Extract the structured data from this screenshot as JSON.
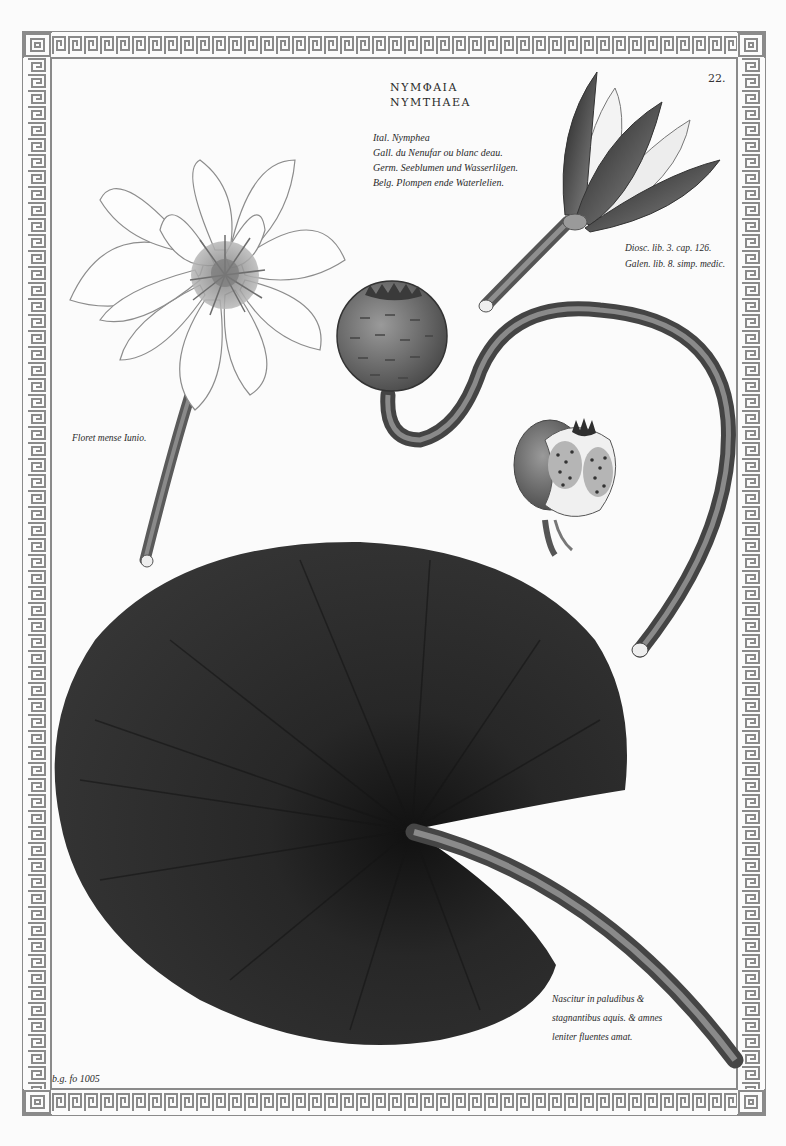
{
  "plate": {
    "page_number": "22.",
    "title": {
      "greek": "ΝΥΜΦΑΙΑ",
      "latin": "NYMTHAEA"
    },
    "vernacular_names": [
      "Ital. Nymphea",
      "Gall. du Nenufar ou blanc deau.",
      "Germ. Seeblumen und Wasserlilgen.",
      "Belg. Plompen ende Waterlelien."
    ],
    "references": [
      "Diosc. lib. 3. cap. 126.",
      "Galen. lib. 8. simp. medic."
    ],
    "bloom_note": "Floret mense Iunio.",
    "habitat_note": [
      "Nascitur in paludibus &",
      "stagnantibus aquis. & amnes",
      "leniter fluentes amat."
    ],
    "signature": "b.g. fo 1005"
  },
  "illustration": {
    "subjects": [
      "open-white-water-lily-flower",
      "closed-flower-bud",
      "seed-pod-on-curved-stem",
      "cut-seed-pod-cross-section",
      "large-dark-lily-pad-leaf"
    ],
    "colors": {
      "paper": "#fbfbfb",
      "ink": "#2a2a2a",
      "border": "#8a8a8a",
      "leaf": "#2b2b2b",
      "stem": "#6a6a6a"
    }
  }
}
